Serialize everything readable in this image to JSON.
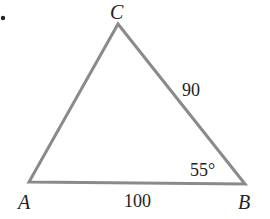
{
  "diagram": {
    "type": "triangle",
    "line_color": "#8a8a8a",
    "text_color": "#222222",
    "vertices": {
      "A": {
        "label": "A",
        "x": 29,
        "y": 182
      },
      "B": {
        "label": "B",
        "x": 245,
        "y": 184
      },
      "C": {
        "label": "C",
        "x": 118,
        "y": 24
      }
    },
    "sides": {
      "AB": {
        "label": "100"
      },
      "BC": {
        "label": "90"
      }
    },
    "angles": {
      "B": {
        "label": "55°"
      }
    },
    "bullet": "•"
  }
}
